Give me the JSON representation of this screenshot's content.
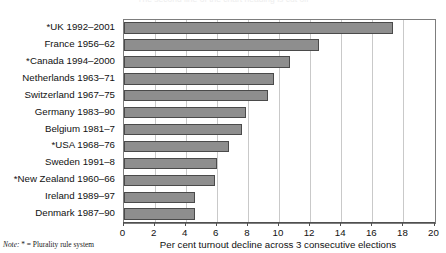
{
  "clipped_title": "The second line of the chart heading is cut off",
  "note": {
    "word": "Note:",
    "text": " * = Plurality rule system"
  },
  "chart_data": {
    "type": "bar",
    "orientation": "horizontal",
    "title": "",
    "xlabel": "Per cent turnout decline across 3 consecutive elections",
    "ylabel": "",
    "xlim": [
      0,
      20
    ],
    "xticks": [
      0,
      2,
      4,
      6,
      8,
      10,
      12,
      14,
      16,
      18,
      20
    ],
    "xtick_labels": [
      "0",
      "2",
      "4",
      "6",
      "8",
      "10",
      "12",
      "14",
      "16",
      "18",
      "20"
    ],
    "grid": true,
    "grid_axis": "x",
    "legend": false,
    "bar_color": "#8e8e8e",
    "bar_edge_color": "#4a4a4a",
    "categories": [
      "*UK 1992–2001",
      "France 1956–62",
      "*Canada 1994–2000",
      "Netherlands 1963–71",
      "Switzerland 1967–75",
      "Germany 1983–90",
      "Belgium 1981–7",
      "*USA 1968–76",
      "Sweden 1991–8",
      "*New Zealand 1960–66",
      "Ireland 1989–97",
      "Denmark 1987–90"
    ],
    "values": [
      17.3,
      12.6,
      10.7,
      9.7,
      9.3,
      7.9,
      7.6,
      6.8,
      6.0,
      5.9,
      4.6,
      4.6
    ]
  }
}
